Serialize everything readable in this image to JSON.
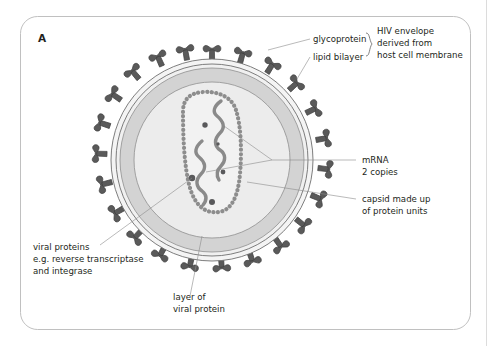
{
  "figure": {
    "panel_label": "A",
    "labels": [
      {
        "id": "glycoprotein",
        "text": "glycoprotein"
      },
      {
        "id": "lipid-bilayer",
        "text": "lipid bilayer"
      },
      {
        "id": "hiv-envelope",
        "line1": "HIV envelope",
        "line2": "derived from",
        "line3": "host cell membrane"
      },
      {
        "id": "mrna",
        "line1": "mRNA",
        "line2": "2 copies"
      },
      {
        "id": "capsid",
        "line1": "capsid made up",
        "line2": "of protein units"
      },
      {
        "id": "viral-proteins",
        "line1": "viral proteins",
        "line2": "e.g. reverse transcriptase",
        "line3": "and integrase"
      },
      {
        "id": "layer-viral-protein",
        "line1": "layer of",
        "line2": "viral protein"
      }
    ]
  },
  "colors": {
    "background": "#ffffff",
    "spike": "#5a5a5a",
    "spike_outline": "#3f3f3f",
    "envelope_outer": "#f3f3f3",
    "protein_layer": "#d5d5d5",
    "inner_core": "#ededed",
    "capsid_bead": "#909090",
    "mrna_strand": "#8a8a8a",
    "viral_protein_dot": "#59595b",
    "leader_line": "#8c8c8c",
    "frame": "#b9b9b9",
    "text": "#231f20"
  }
}
